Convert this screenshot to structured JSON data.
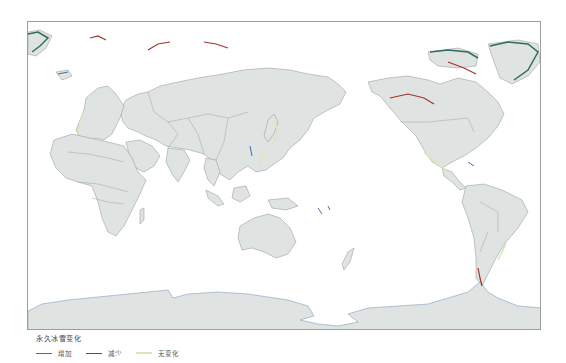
{
  "map": {
    "projection": "Pacific-centered world map",
    "colors": {
      "land": "#dfe3e1",
      "border": "#8e9390",
      "ocean": "#ffffff",
      "frame": "#9a9e9c",
      "increase": "#3d6fb0",
      "decrease": "#a8322b",
      "no_change": "#dde6b8",
      "glacier_dense": "#2f6e5c"
    }
  },
  "legend": {
    "title": "永久冰雪变化",
    "items": [
      {
        "label": "增加",
        "color": "#3d6fb0"
      },
      {
        "label": "减少",
        "color": "#a8322b"
      },
      {
        "label": "无变化",
        "color": "#dde6b8"
      }
    ]
  }
}
